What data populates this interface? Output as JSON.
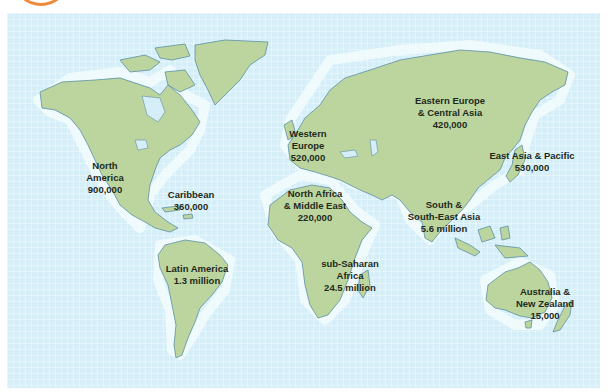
{
  "map": {
    "type": "world-choropleth-labels",
    "colors": {
      "ocean": "#d6eef8",
      "land": "#bcd59f",
      "coast": "#5c8fa3",
      "text": "#1f2a1c",
      "accent": "#ee8a3c"
    },
    "regions": [
      {
        "id": "north-america",
        "lines": [
          "North",
          "America",
          "900,000"
        ],
        "name": "North America",
        "value": "900,000"
      },
      {
        "id": "caribbean",
        "lines": [
          "Caribbean",
          "360,000"
        ],
        "name": "Caribbean",
        "value": "360,000"
      },
      {
        "id": "latin-america",
        "lines": [
          "Latin America",
          "1.3 million"
        ],
        "name": "Latin America",
        "value": "1.3 million"
      },
      {
        "id": "western-europe",
        "lines": [
          "Western",
          "Europe",
          "520,000"
        ],
        "name": "Western Europe",
        "value": "520,000"
      },
      {
        "id": "eastern-europe-central-asia",
        "lines": [
          "Eastern Europe",
          "& Central Asia",
          "420,000"
        ],
        "name": "Eastern Europe & Central Asia",
        "value": "420,000"
      },
      {
        "id": "east-asia-pacific",
        "lines": [
          "East Asia & Pacific",
          "530,000"
        ],
        "name": "East Asia & Pacific",
        "value": "530,000"
      },
      {
        "id": "north-africa-middle-east",
        "lines": [
          "North Africa",
          "& Middle East",
          "220,000"
        ],
        "name": "North Africa & Middle East",
        "value": "220,000"
      },
      {
        "id": "south-southeast-asia",
        "lines": [
          "South &",
          "South-East Asia",
          "5.6 million"
        ],
        "name": "South & South-East Asia",
        "value": "5.6 million"
      },
      {
        "id": "sub-saharan-africa",
        "lines": [
          "sub-Saharan",
          "Africa",
          "24.5 million"
        ],
        "name": "sub-Saharan Africa",
        "value": "24.5 million"
      },
      {
        "id": "australia-new-zealand",
        "lines": [
          "Australia &",
          "New Zealand",
          "15,000"
        ],
        "name": "Australia & New Zealand",
        "value": "15,000"
      }
    ]
  }
}
